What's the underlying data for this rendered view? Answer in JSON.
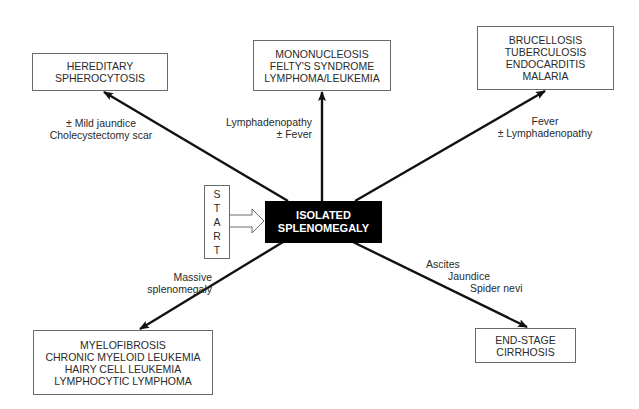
{
  "diagram": {
    "start": {
      "letters": [
        "S",
        "T",
        "A",
        "R",
        "T"
      ]
    },
    "center": {
      "lines": [
        "ISOLATED",
        "SPLENOMEGALY"
      ]
    },
    "branches": [
      {
        "id": "hereditary",
        "condition": [
          "± Mild jaundice",
          "Cholecystectomy scar"
        ],
        "outcome": [
          "HEREDITARY",
          "SPHEROCYTOSIS"
        ]
      },
      {
        "id": "mono",
        "condition": [
          "Lymphadenopathy",
          "± Fever"
        ],
        "outcome": [
          "MONONUCLEOSIS",
          "FELTY'S SYNDROME",
          "LYMPHOMA/LEUKEMIA"
        ]
      },
      {
        "id": "infection",
        "condition": [
          "Fever",
          "± Lymphadenopathy"
        ],
        "outcome": [
          "BRUCELLOSIS",
          "TUBERCULOSIS",
          "ENDOCARDITIS",
          "MALARIA"
        ]
      },
      {
        "id": "massive",
        "condition": [
          "Massive",
          "splenomegaly"
        ],
        "outcome": [
          "MYELOFIBROSIS",
          "CHRONIC MYELOID LEUKEMIA",
          "HAIRY CELL LEUKEMIA",
          "LYMPHOCYTIC LYMPHOMA"
        ]
      },
      {
        "id": "cirrhosis",
        "condition": [
          "Ascites",
          "Jaundice",
          "Spider nevi"
        ],
        "outcome": [
          "END-STAGE",
          "CIRRHOSIS"
        ]
      }
    ]
  }
}
